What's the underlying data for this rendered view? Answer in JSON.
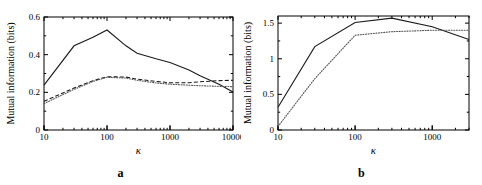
{
  "figure": {
    "panels": [
      {
        "letter": "a"
      },
      {
        "letter": "b"
      }
    ]
  },
  "chart_data": [
    {
      "type": "line",
      "panel": "a",
      "title": "",
      "xlabel": "κ",
      "ylabel": "Mutual information (bits)",
      "xscale": "log",
      "xlim": [
        10,
        10000
      ],
      "ylim": [
        0,
        0.6
      ],
      "xticks": [
        10,
        100,
        1000,
        10000
      ],
      "xticklabels": [
        "10",
        "100",
        "1000",
        "10000"
      ],
      "yticks": [
        0,
        0.2,
        0.4,
        0.6
      ],
      "yticklabels": [
        "0",
        "0.2",
        "0.4",
        "0.6"
      ],
      "grid": false,
      "legend": "none",
      "x": [
        10,
        30,
        60,
        100,
        200,
        300,
        600,
        1000,
        2000,
        3000,
        6000,
        10000
      ],
      "series": [
        {
          "name": "solid",
          "style": "solid",
          "values": [
            0.238,
            0.447,
            0.492,
            0.531,
            0.447,
            0.408,
            0.378,
            0.358,
            0.318,
            0.288,
            0.243,
            0.202
          ]
        },
        {
          "name": "dashed",
          "style": "dashed",
          "values": [
            0.152,
            0.223,
            0.262,
            0.283,
            0.281,
            0.27,
            0.258,
            0.251,
            0.251,
            0.256,
            0.262,
            0.264
          ]
        },
        {
          "name": "dotted",
          "style": "dotted",
          "values": [
            0.14,
            0.216,
            0.258,
            0.28,
            0.276,
            0.264,
            0.25,
            0.243,
            0.238,
            0.235,
            0.232,
            0.23
          ]
        }
      ]
    },
    {
      "type": "line",
      "panel": "b",
      "title": "",
      "xlabel": "κ",
      "ylabel": "Mutual information (bits)",
      "xscale": "log",
      "xlim": [
        10,
        3000
      ],
      "ylim": [
        0,
        1.6
      ],
      "xticks": [
        10,
        100,
        1000
      ],
      "xticklabels": [
        "10",
        "100",
        "1000"
      ],
      "yticks": [
        0,
        0.5,
        1,
        1.5
      ],
      "yticklabels": [
        "0",
        "0.5",
        "1",
        "1.5"
      ],
      "grid": false,
      "legend": "none",
      "x": [
        10,
        30,
        100,
        300,
        1000,
        3000
      ],
      "series": [
        {
          "name": "solid",
          "style": "solid",
          "values": [
            0.32,
            1.17,
            1.51,
            1.57,
            1.45,
            1.27
          ]
        },
        {
          "name": "dotted",
          "style": "dotted",
          "values": [
            0.05,
            0.72,
            1.33,
            1.38,
            1.4,
            1.4
          ]
        }
      ]
    }
  ]
}
